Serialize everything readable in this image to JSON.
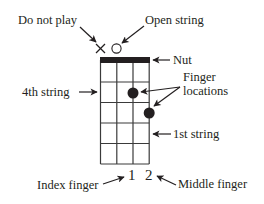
{
  "diagram": {
    "type": "chord-chart",
    "strings": 4,
    "frets": 5,
    "colors": {
      "ink": "#231f20",
      "grid": "#3a3a3a",
      "background": "#ffffff"
    },
    "markers": {
      "do_not_play": {
        "string": 4,
        "symbol": "×"
      },
      "open_string": {
        "string": 3,
        "symbol": "○"
      }
    },
    "finger_dots": [
      {
        "string": 2,
        "fret": 2
      },
      {
        "string": 1,
        "fret": 3
      }
    ],
    "finger_numbers": [
      "1",
      "2"
    ]
  },
  "labels": {
    "do_not_play": "Do not play",
    "open_string": "Open string",
    "nut": "Nut",
    "finger_locations_line1": "Finger",
    "finger_locations_line2": "locations",
    "fourth_string": "4th string",
    "first_string": "1st string",
    "index_finger": "Index finger",
    "middle_finger": "Middle finger",
    "finger_number_1": "1",
    "finger_number_2": "2"
  }
}
